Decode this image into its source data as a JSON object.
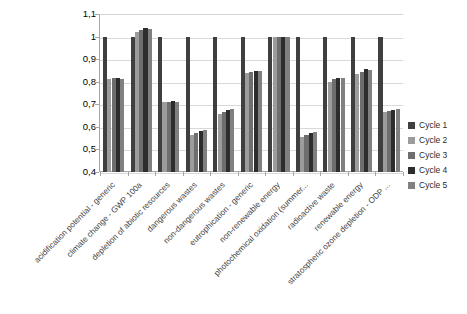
{
  "chart_data": {
    "type": "bar",
    "title": "",
    "subtitle": "",
    "xlabel": "",
    "ylabel": "",
    "ylim": [
      0.4,
      1.1
    ],
    "ytick_labels": [
      "1,1",
      "1",
      "0,9",
      "0,8",
      "0,7",
      "0,6",
      "0,5",
      "0,4"
    ],
    "ytick_values": [
      1.1,
      1.0,
      0.9,
      0.8,
      0.7,
      0.6,
      0.5,
      0.4
    ],
    "grid": true,
    "legend_position": "right",
    "decimal_separator": ",",
    "categories": [
      "acidification potential - generic",
      "climate change - GWP 100a",
      "depletion of abiotic resources",
      "dangerous wastes",
      "non-dangerous wastes",
      "eutrophication - generic",
      "non-renewable energy",
      "photochemical oxidation (summer...",
      "radioactive waste",
      "renewable energy",
      "stratospheric ozone depletion - ODP ..."
    ],
    "series": [
      {
        "name": "Cycle 1",
        "color": "#3f3f3f",
        "values": [
          1.0,
          1.0,
          1.0,
          1.0,
          1.0,
          1.0,
          1.0,
          1.0,
          1.0,
          1.0,
          1.0
        ]
      },
      {
        "name": "Cycle 2",
        "color": "#9c9c9c",
        "values": [
          0.81,
          1.02,
          0.71,
          0.565,
          0.655,
          0.84,
          1.0,
          0.555,
          0.8,
          0.835,
          0.665
        ]
      },
      {
        "name": "Cycle 3",
        "color": "#6e6e6e",
        "values": [
          0.815,
          1.03,
          0.712,
          0.575,
          0.665,
          0.845,
          1.0,
          0.565,
          0.81,
          0.845,
          0.672
        ]
      },
      {
        "name": "Cycle 4",
        "color": "#2d2d2d",
        "values": [
          0.818,
          1.04,
          0.713,
          0.582,
          0.675,
          0.848,
          1.0,
          0.572,
          0.815,
          0.855,
          0.675
        ]
      },
      {
        "name": "Cycle 5",
        "color": "#808080",
        "values": [
          0.812,
          1.035,
          0.711,
          0.585,
          0.678,
          0.846,
          1.0,
          0.578,
          0.818,
          0.852,
          0.677
        ]
      }
    ]
  },
  "legend": {
    "items": [
      {
        "label": "Cycle 1",
        "color": "#3f3f3f"
      },
      {
        "label": "Cycle 2",
        "color": "#9c9c9c"
      },
      {
        "label": "Cycle 3",
        "color": "#6e6e6e"
      },
      {
        "label": "Cycle 4",
        "color": "#2d2d2d"
      },
      {
        "label": "Cycle 5",
        "color": "#808080"
      }
    ]
  },
  "colors": {
    "plot_background": "#ffffff",
    "gridline": "#d9d9d9",
    "axis": "#a6a6a6",
    "label_text": "#3f3f3f"
  }
}
